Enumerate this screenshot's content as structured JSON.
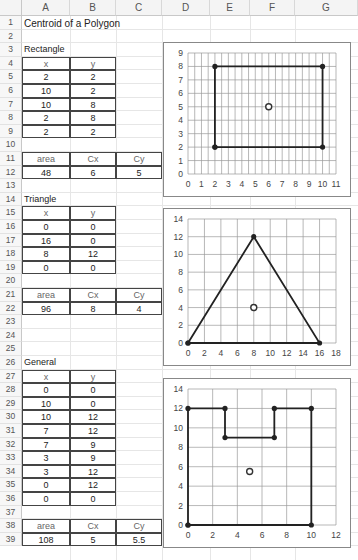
{
  "columns": [
    "A",
    "B",
    "C",
    "D",
    "E",
    "F",
    "G"
  ],
  "rows": [
    "1",
    "2",
    "3",
    "4",
    "5",
    "6",
    "7",
    "8",
    "9",
    "10",
    "11",
    "12",
    "13",
    "14",
    "15",
    "16",
    "17",
    "18",
    "19",
    "20",
    "21",
    "22",
    "23",
    "24",
    "25",
    "26",
    "27",
    "28",
    "29",
    "30",
    "31",
    "32",
    "33",
    "34",
    "35",
    "36",
    "37",
    "38",
    "39"
  ],
  "title": "Centroid of a Polygon",
  "rectangle": {
    "label": "Rectangle",
    "headers": {
      "x": "x",
      "y": "y"
    },
    "points": [
      [
        "2",
        "2"
      ],
      [
        "10",
        "2"
      ],
      [
        "10",
        "8"
      ],
      [
        "2",
        "8"
      ],
      [
        "2",
        "2"
      ]
    ],
    "result_headers": {
      "area": "area",
      "cx": "Cx",
      "cy": "Cy"
    },
    "result": {
      "area": "48",
      "cx": "6",
      "cy": "5"
    }
  },
  "triangle": {
    "label": "Triangle",
    "headers": {
      "x": "x",
      "y": "y"
    },
    "points": [
      [
        "0",
        "0"
      ],
      [
        "16",
        "0"
      ],
      [
        "8",
        "12"
      ],
      [
        "0",
        "0"
      ]
    ],
    "result_headers": {
      "area": "area",
      "cx": "Cx",
      "cy": "Cy"
    },
    "result": {
      "area": "96",
      "cx": "8",
      "cy": "4"
    }
  },
  "general": {
    "label": "General",
    "headers": {
      "x": "x",
      "y": "y"
    },
    "points": [
      [
        "0",
        "0"
      ],
      [
        "10",
        "0"
      ],
      [
        "10",
        "12"
      ],
      [
        "7",
        "12"
      ],
      [
        "7",
        "9"
      ],
      [
        "3",
        "9"
      ],
      [
        "3",
        "12"
      ],
      [
        "0",
        "12"
      ],
      [
        "0",
        "0"
      ]
    ],
    "result_headers": {
      "area": "area",
      "cx": "Cx",
      "cy": "Cy"
    },
    "result": {
      "area": "108",
      "cx": "5",
      "cy": "5.5"
    }
  },
  "chart_data": [
    {
      "type": "scatter",
      "title": "",
      "xlabel": "",
      "ylabel": "",
      "xlim": [
        0,
        11
      ],
      "ylim": [
        0,
        9
      ],
      "x_ticks": [
        "0",
        "1",
        "2",
        "3",
        "4",
        "5",
        "6",
        "7",
        "8",
        "9",
        "10",
        "11"
      ],
      "y_ticks": [
        "0",
        "1",
        "2",
        "3",
        "4",
        "5",
        "6",
        "7",
        "8",
        "9"
      ],
      "grid": true,
      "series": [
        {
          "name": "Rectangle",
          "style": "line-markers",
          "points": [
            [
              2,
              2
            ],
            [
              10,
              2
            ],
            [
              10,
              8
            ],
            [
              2,
              8
            ],
            [
              2,
              2
            ]
          ]
        },
        {
          "name": "Centroid",
          "style": "open-circle",
          "points": [
            [
              6,
              5
            ]
          ]
        }
      ]
    },
    {
      "type": "scatter",
      "title": "",
      "xlabel": "",
      "ylabel": "",
      "xlim": [
        0,
        18
      ],
      "ylim": [
        0,
        14
      ],
      "x_ticks": [
        "0",
        "2",
        "4",
        "6",
        "8",
        "10",
        "12",
        "14",
        "16",
        "18"
      ],
      "y_ticks": [
        "0",
        "2",
        "4",
        "6",
        "8",
        "10",
        "12",
        "14"
      ],
      "grid": true,
      "series": [
        {
          "name": "Triangle",
          "style": "line-markers",
          "points": [
            [
              0,
              0
            ],
            [
              16,
              0
            ],
            [
              8,
              12
            ],
            [
              0,
              0
            ]
          ]
        },
        {
          "name": "Centroid",
          "style": "open-circle",
          "points": [
            [
              8,
              4
            ]
          ]
        }
      ]
    },
    {
      "type": "scatter",
      "title": "",
      "xlabel": "",
      "ylabel": "",
      "xlim": [
        0,
        12
      ],
      "ylim": [
        0,
        14
      ],
      "x_ticks": [
        "0",
        "2",
        "4",
        "6",
        "8",
        "10",
        "12"
      ],
      "y_ticks": [
        "0",
        "2",
        "4",
        "6",
        "8",
        "10",
        "12",
        "14"
      ],
      "grid": true,
      "series": [
        {
          "name": "General",
          "style": "line-markers",
          "points": [
            [
              0,
              0
            ],
            [
              10,
              0
            ],
            [
              10,
              12
            ],
            [
              7,
              12
            ],
            [
              7,
              9
            ],
            [
              3,
              9
            ],
            [
              3,
              12
            ],
            [
              0,
              12
            ],
            [
              0,
              0
            ]
          ]
        },
        {
          "name": "Centroid",
          "style": "open-circle",
          "points": [
            [
              5,
              5.5
            ]
          ]
        }
      ]
    }
  ]
}
